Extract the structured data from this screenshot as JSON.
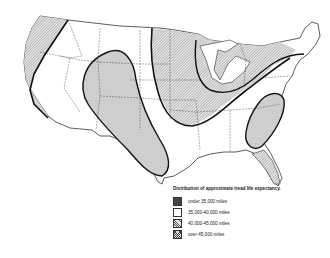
{
  "map": {
    "subject": "Map of the contiguous United States showing zones of approximate tire tread life expectancy",
    "legend": {
      "title": "Distribution of approximate tread life expectancy.",
      "items": [
        {
          "label": "under 35,000 miles",
          "pattern": "dots"
        },
        {
          "label": "35,000-40,000 miles",
          "pattern": "blank"
        },
        {
          "label": "40,000-45,000 miles",
          "pattern": "hatch"
        },
        {
          "label": "over 45,000 miles",
          "pattern": "cross"
        }
      ]
    },
    "colors": {
      "ink": "#222222",
      "background": "#ffffff"
    }
  }
}
